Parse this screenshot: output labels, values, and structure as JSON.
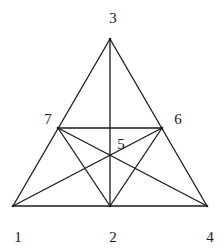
{
  "diagram": {
    "type": "graph",
    "nodes": [
      {
        "id": "1",
        "label": "1",
        "x": 13,
        "y": 206,
        "lx": 18,
        "ly": 242
      },
      {
        "id": "2",
        "label": "2",
        "x": 110,
        "y": 206,
        "lx": 113,
        "ly": 242
      },
      {
        "id": "3",
        "label": "3",
        "x": 110,
        "y": 39,
        "lx": 113,
        "ly": 23
      },
      {
        "id": "4",
        "label": "4",
        "x": 207,
        "y": 206,
        "lx": 210,
        "ly": 242
      },
      {
        "id": "5",
        "label": "5",
        "x": 110,
        "y": 155,
        "lx": 121,
        "ly": 149
      },
      {
        "id": "6",
        "label": "6",
        "x": 162,
        "y": 128,
        "lx": 178,
        "ly": 124
      },
      {
        "id": "7",
        "label": "7",
        "x": 58,
        "y": 128,
        "lx": 48,
        "ly": 124
      }
    ],
    "edges": [
      [
        "1",
        "4"
      ],
      [
        "1",
        "3"
      ],
      [
        "3",
        "4"
      ],
      [
        "3",
        "2"
      ],
      [
        "7",
        "6"
      ],
      [
        "7",
        "4"
      ],
      [
        "1",
        "6"
      ],
      [
        "7",
        "2"
      ],
      [
        "6",
        "2"
      ]
    ],
    "colors": {
      "line": "#1a1a1a",
      "background": "#ffffff"
    }
  }
}
